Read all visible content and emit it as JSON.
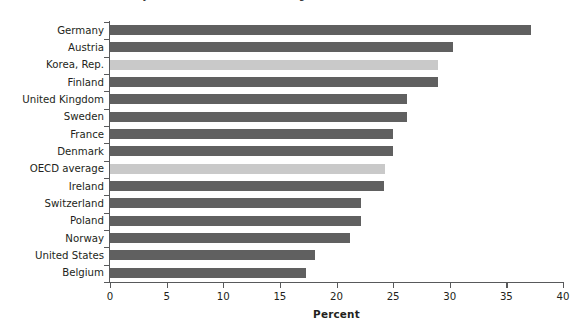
{
  "figure": {
    "caption": "FIGURE 5.6  Share of tertiary educated in the labor force (ages 25-64), 2016",
    "caption_visible": "clipped"
  },
  "chart_data": {
    "type": "bar",
    "orientation": "horizontal",
    "title": "",
    "xlabel": "Percent",
    "ylabel": "",
    "xlim": [
      0,
      40
    ],
    "xticks": [
      0,
      5,
      10,
      15,
      20,
      25,
      30,
      35,
      40
    ],
    "grid": false,
    "legend": "none",
    "categories": [
      "Germany",
      "Austria",
      "Korea, Rep.",
      "Finland",
      "United Kingdom",
      "Sweden",
      "France",
      "Denmark",
      "OECD average",
      "Ireland",
      "Switzerland",
      "Poland",
      "Norway",
      "United States",
      "Belgium"
    ],
    "values": [
      37.2,
      30.3,
      29.0,
      29.0,
      26.2,
      26.2,
      25.0,
      25.0,
      24.3,
      24.2,
      22.2,
      22.2,
      21.2,
      18.1,
      17.3
    ],
    "highlight": [
      "Korea, Rep.",
      "OECD average"
    ],
    "colors": {
      "bar": "#606060",
      "bar_highlight": "#c9c9c9",
      "axis": "#58595b",
      "text": "#231f20",
      "background": "#ffffff"
    }
  }
}
